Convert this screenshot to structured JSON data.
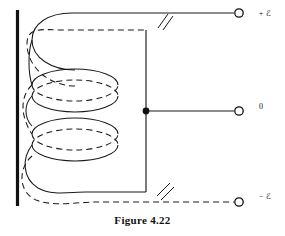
{
  "figure": {
    "caption": "Figure 4.22"
  },
  "colors": {
    "ink": "#111111",
    "line": "#1a1a1a",
    "background": "#ffffff"
  },
  "core": {
    "name": "vertical-core-bar",
    "x": 17,
    "y_top": 10,
    "y_bottom": 206,
    "thickness": 3
  },
  "coil": {
    "turns": 2,
    "style": "helix drawn as ellipses, solid front arc and dashed rear arc",
    "ellipse_cx": 75,
    "ellipse_rx": 43,
    "ellipse_ry": 16,
    "turn_centers_y": [
      85,
      134
    ]
  },
  "bus": {
    "name": "vertical-bus",
    "x": 146,
    "y_top": 30,
    "y_bottom": 192
  },
  "junction": {
    "name": "center-tap-junction-dot",
    "x": 146,
    "y": 111,
    "radius": 3.4
  },
  "break_marks": [
    {
      "label": "top-wire-break",
      "x": 163,
      "y": 22
    },
    {
      "label": "bottom-wire-break",
      "x": 163,
      "y": 190
    }
  ],
  "terminals": [
    {
      "id": "terminal-positive",
      "label": "+ ℰ",
      "label_prefix": "+",
      "label_symbol": "ℰ",
      "lead_style": "solid",
      "cx": 239,
      "cy": 13,
      "r": 4.2
    },
    {
      "id": "terminal-zero",
      "label": "0",
      "label_prefix": "",
      "label_symbol": "0",
      "lead_style": "solid",
      "cx": 239,
      "cy": 111,
      "r": 4.2
    },
    {
      "id": "terminal-negative",
      "label": "− ℰ",
      "label_prefix": "−",
      "label_symbol": "ℰ",
      "lead_style": "dashed",
      "cx": 239,
      "cy": 202,
      "r": 4.2
    }
  ]
}
